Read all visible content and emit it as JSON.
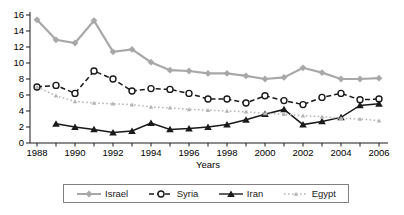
{
  "chart_data": {
    "type": "line",
    "title": "",
    "xlabel": "Years",
    "ylabel": "",
    "x": [
      1988,
      1989,
      1990,
      1991,
      1992,
      1993,
      1994,
      1995,
      1996,
      1997,
      1998,
      1999,
      2000,
      2001,
      2002,
      2003,
      2004,
      2005,
      2006
    ],
    "x_tick_labels": [
      "1988",
      "1990",
      "1992",
      "1994",
      "1996",
      "1998",
      "2000",
      "2002",
      "2004",
      "2006"
    ],
    "y_ticks": [
      "0",
      "2",
      "4",
      "6",
      "8",
      "10",
      "12",
      "14",
      "16"
    ],
    "ylim": [
      0,
      16
    ],
    "grid": false,
    "legend_position": "bottom",
    "series": [
      {
        "name": "Israel",
        "color": "#a8a8a8",
        "line": "solid",
        "marker": "diamond",
        "values": [
          15.4,
          12.9,
          12.5,
          15.3,
          11.4,
          11.7,
          10.1,
          9.1,
          9.0,
          8.7,
          8.7,
          8.4,
          8.0,
          8.2,
          9.4,
          8.8,
          8.0,
          8.0,
          8.1
        ]
      },
      {
        "name": "Syria",
        "color": "#1a1a1a",
        "line": "dashed",
        "marker": "circle-open",
        "values": [
          7.0,
          7.2,
          6.2,
          9.0,
          8.0,
          6.5,
          6.8,
          6.7,
          6.2,
          5.5,
          5.5,
          5.0,
          5.9,
          5.3,
          4.8,
          5.7,
          6.2,
          5.4,
          5.5
        ]
      },
      {
        "name": "Iran",
        "color": "#1a1a1a",
        "line": "solid",
        "marker": "triangle",
        "values": [
          null,
          2.4,
          2.0,
          1.7,
          1.3,
          1.5,
          2.5,
          1.7,
          1.8,
          2.0,
          2.3,
          2.9,
          3.6,
          4.2,
          2.3,
          2.7,
          3.2,
          4.7,
          4.9
        ]
      },
      {
        "name": "Egypt",
        "color": "#b5b5b5",
        "line": "dotted",
        "marker": "triangle-small",
        "values": [
          7.0,
          5.9,
          5.2,
          5.0,
          4.9,
          4.8,
          4.5,
          4.4,
          4.2,
          4.1,
          4.0,
          3.9,
          3.7,
          3.6,
          3.4,
          3.3,
          3.1,
          3.0,
          2.8
        ]
      }
    ]
  }
}
